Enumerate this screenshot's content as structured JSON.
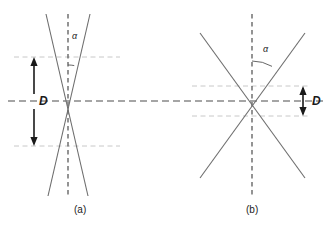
{
  "figure": {
    "background_color": "#ffffff",
    "line_color": "#6e6e6e",
    "axis_color": "#4d4d4d",
    "guide_color": "#c8c8c8",
    "arrow_color": "#1a1a1a",
    "text_color": "#1a1a1a",
    "width": 333,
    "height": 225
  },
  "chart_data": {
    "type": "diagram",
    "title": "",
    "panels": [
      {
        "id": "a",
        "caption": "(a)",
        "caption_x": 74,
        "caption_y": 205,
        "crossing_point": [
          68,
          101
        ],
        "vertical_axis_x": 68,
        "vertical_axis_top": 14,
        "vertical_axis_bottom": 196,
        "half_angle_deg": 10,
        "angle_label": "α",
        "angle_label_x": 72,
        "angle_label_y": 32,
        "angle_arc_radius": 36,
        "guide_upper_y": 57,
        "guide_lower_y": 146,
        "guide_x_start": 14,
        "guide_x_end": 120,
        "dimension_label": "D",
        "dimension_label_x": 39,
        "dimension_label_y": 95,
        "arrow_x": 34,
        "arrow_top_y": 57,
        "arrow_bottom_y": 146,
        "arrow_gap_top": 94,
        "arrow_gap_bottom": 109,
        "line1_start": [
          46,
          14
        ],
        "line1_end": [
          88,
          196
        ],
        "line2_start": [
          90,
          14
        ],
        "line2_end": [
          48,
          196
        ]
      },
      {
        "id": "b",
        "caption": "(b)",
        "caption_x": 246,
        "caption_y": 205,
        "crossing_point": [
          252,
          101
        ],
        "vertical_axis_x": 252,
        "vertical_axis_top": 14,
        "vertical_axis_bottom": 196,
        "half_angle_deg": 30,
        "angle_label": "α",
        "angle_label_x": 263,
        "angle_label_y": 45,
        "angle_arc_radius": 40,
        "guide_upper_y": 86,
        "guide_lower_y": 116,
        "guide_x_start": 192,
        "guide_x_end": 308,
        "dimension_label": "D",
        "dimension_label_x": 312,
        "dimension_label_y": 95,
        "arrow_x": 303,
        "arrow_top_y": 86,
        "arrow_bottom_y": 116,
        "line1_start": [
          200,
          33
        ],
        "line1_end": [
          305,
          178
        ],
        "line2_start": [
          305,
          33
        ],
        "line2_end": [
          200,
          178
        ]
      }
    ],
    "main_axis": {
      "label": "horizontal-optical-axis",
      "y": 101,
      "x_start": 8,
      "x_end": 326
    }
  }
}
